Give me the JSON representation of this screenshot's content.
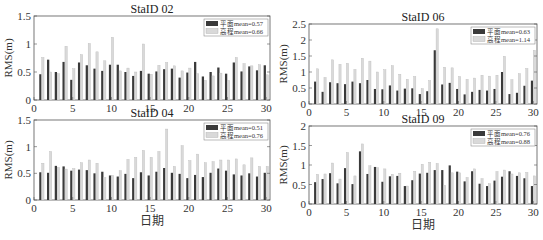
{
  "colors": {
    "primary": "#3a3a3a",
    "secondary": "#d9d9d9",
    "axis": "#555555"
  },
  "chart_data": [
    {
      "type": "bar",
      "title": "StaID 02",
      "xlabel": "",
      "ylabel": "RMS(m)",
      "ylim": [
        0,
        1.5
      ],
      "yticks": [
        0,
        0.5,
        1,
        1.5
      ],
      "xticks": [
        0,
        5,
        10,
        15,
        20,
        25,
        30
      ],
      "x": [
        1,
        2,
        3,
        4,
        5,
        6,
        7,
        8,
        9,
        10,
        11,
        12,
        13,
        14,
        15,
        16,
        17,
        18,
        19,
        20,
        21,
        22,
        23,
        24,
        25,
        26,
        27,
        28,
        29,
        30
      ],
      "legend_position": "upper right",
      "series": [
        {
          "name": "平面mean=0.57",
          "values": [
            0.46,
            0.72,
            0.5,
            0.68,
            0.36,
            0.67,
            0.62,
            0.56,
            0.52,
            0.63,
            0.63,
            0.5,
            0.43,
            0.52,
            0.47,
            0.51,
            0.55,
            0.56,
            0.4,
            0.49,
            0.68,
            0.42,
            0.5,
            0.58,
            0.47,
            0.67,
            0.51,
            0.6,
            0.53,
            0.62
          ]
        },
        {
          "name": "高程mean=0.66",
          "values": [
            0.76,
            0.5,
            0.47,
            0.96,
            0.56,
            0.81,
            1.01,
            0.86,
            0.7,
            1.12,
            0.52,
            0.57,
            0.5,
            1.0,
            0.46,
            0.62,
            0.67,
            0.61,
            0.52,
            0.57,
            0.47,
            0.35,
            0.43,
            0.48,
            0.35,
            0.76,
            0.65,
            0.61,
            0.63,
            0.45
          ]
        }
      ]
    },
    {
      "type": "bar",
      "title": "StaID 06",
      "xlabel": "",
      "ylabel": "RMS(m)",
      "ylim": [
        0,
        2.5
      ],
      "yticks": [
        0,
        0.5,
        1,
        1.5,
        2,
        2.5
      ],
      "xticks": [
        0,
        5,
        10,
        15,
        20,
        25,
        30
      ],
      "x": [
        1,
        2,
        3,
        4,
        5,
        6,
        7,
        8,
        9,
        10,
        11,
        12,
        13,
        14,
        15,
        16,
        17,
        18,
        19,
        20,
        21,
        22,
        23,
        24,
        25,
        26,
        27,
        28,
        29,
        30
      ],
      "legend_position": "upper right",
      "series": [
        {
          "name": "平面mean=0.63",
          "values": [
            0.7,
            0.38,
            0.68,
            0.65,
            0.62,
            0.7,
            0.65,
            0.75,
            0.47,
            0.46,
            0.58,
            0.42,
            0.48,
            0.49,
            0.31,
            0.4,
            1.68,
            0.61,
            0.66,
            0.47,
            0.3,
            0.38,
            0.44,
            0.42,
            0.47,
            1.0,
            0.31,
            0.35,
            0.57,
            0.73
          ]
        },
        {
          "name": "高程mean=1.14",
          "values": [
            1.1,
            0.83,
            1.38,
            1.24,
            1.27,
            1.08,
            1.43,
            1.34,
            1.0,
            1.07,
            1.2,
            0.93,
            0.77,
            0.86,
            0.48,
            0.73,
            2.35,
            1.15,
            1.13,
            0.86,
            0.77,
            0.81,
            0.9,
            0.87,
            0.9,
            1.49,
            0.76,
            0.95,
            1.11,
            1.68
          ]
        }
      ]
    },
    {
      "type": "bar",
      "title": "StaID 04",
      "xlabel": "日期",
      "ylabel": "RMS(m)",
      "ylim": [
        0,
        1.5
      ],
      "yticks": [
        0,
        0.5,
        1,
        1.5
      ],
      "xticks": [
        0,
        5,
        10,
        15,
        20,
        25,
        30
      ],
      "x": [
        1,
        2,
        3,
        4,
        5,
        6,
        7,
        8,
        9,
        10,
        11,
        12,
        13,
        14,
        15,
        16,
        17,
        18,
        19,
        20,
        21,
        22,
        23,
        24,
        25,
        26,
        27,
        28,
        29,
        30
      ],
      "legend_position": "upper right",
      "series": [
        {
          "name": "平面mean=0.51",
          "values": [
            0.52,
            0.51,
            0.64,
            0.63,
            0.55,
            0.57,
            0.56,
            0.5,
            0.53,
            0.46,
            0.44,
            0.49,
            0.41,
            0.52,
            0.46,
            0.53,
            0.6,
            0.51,
            0.49,
            0.41,
            0.47,
            0.43,
            0.51,
            0.59,
            0.55,
            0.48,
            0.46,
            0.5,
            0.44,
            0.51
          ]
        },
        {
          "name": "高程mean=0.76",
          "values": [
            0.69,
            0.91,
            0.61,
            0.58,
            0.59,
            0.7,
            0.75,
            0.69,
            0.42,
            0.46,
            0.55,
            0.76,
            0.8,
            0.93,
            0.8,
            0.91,
            1.33,
            0.63,
            1.02,
            0.74,
            0.86,
            0.7,
            0.72,
            0.75,
            0.75,
            0.77,
            0.66,
            0.79,
            0.63,
            0.63
          ]
        }
      ]
    },
    {
      "type": "bar",
      "title": "StaID 09",
      "xlabel": "日期",
      "ylabel": "RMS(m)",
      "ylim": [
        0,
        2
      ],
      "yticks": [
        0,
        0.5,
        1,
        1.5,
        2
      ],
      "xticks": [
        0,
        5,
        10,
        15,
        20,
        25,
        30
      ],
      "x": [
        1,
        2,
        3,
        4,
        5,
        6,
        7,
        8,
        9,
        10,
        11,
        12,
        13,
        14,
        15,
        16,
        17,
        18,
        19,
        20,
        21,
        22,
        23,
        24,
        25,
        26,
        27,
        28,
        29,
        30
      ],
      "legend_position": "upper right",
      "series": [
        {
          "name": "平面mean=0.76",
          "values": [
            0.56,
            0.64,
            0.79,
            0.53,
            0.92,
            0.51,
            1.35,
            0.77,
            0.95,
            0.57,
            0.71,
            0.72,
            0.46,
            0.61,
            0.78,
            0.8,
            0.87,
            0.87,
            0.99,
            0.83,
            0.58,
            0.84,
            0.52,
            0.46,
            0.6,
            0.7,
            0.84,
            0.72,
            0.66,
            0.46
          ]
        },
        {
          "name": "高程mean=0.88",
          "values": [
            0.76,
            0.77,
            1.05,
            0.64,
            1.32,
            0.72,
            1.54,
            0.98,
            0.93,
            0.9,
            0.76,
            0.79,
            0.46,
            0.84,
            1.02,
            1.07,
            1.04,
            0.48,
            0.8,
            0.8,
            0.68,
            0.9,
            0.65,
            0.52,
            0.83,
            0.87,
            0.77,
            0.8,
            0.81,
            0.72
          ]
        }
      ]
    }
  ]
}
